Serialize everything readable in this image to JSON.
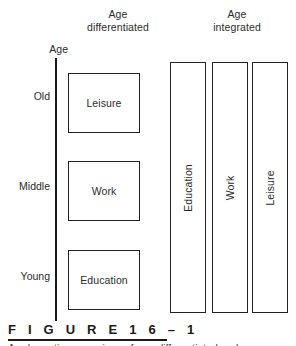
{
  "figure": {
    "caption_label": "F I G U R E   1 6 – 1",
    "caption_subtext": "A schematic comparison of age-differentiated and age-integrated"
  },
  "headers": {
    "differentiated": {
      "line1": "Age",
      "line2": "differentiated"
    },
    "integrated": {
      "line1": "Age",
      "line2": "integrated"
    }
  },
  "axis": {
    "title": "Age",
    "ticks": [
      {
        "label": "Old"
      },
      {
        "label": "Middle"
      },
      {
        "label": "Young"
      }
    ]
  },
  "differentiated_boxes": [
    {
      "label": "Leisure"
    },
    {
      "label": "Work"
    },
    {
      "label": "Education"
    }
  ],
  "integrated_bars": [
    {
      "label": "Education"
    },
    {
      "label": "Work"
    },
    {
      "label": "Leisure"
    }
  ],
  "colors": {
    "stroke": "#222222",
    "text": "#2b2b2b",
    "background": "#ffffff"
  },
  "chart_data": {
    "type": "diagram",
    "ylabel": "Age",
    "ytick_labels": [
      "Old",
      "Middle",
      "Young"
    ],
    "panels": [
      {
        "name": "Age differentiated",
        "elements": [
          "Leisure",
          "Work",
          "Education"
        ],
        "layout": "three separate boxes stacked by life stage: Leisure at Old, Work at Middle, Education at Young"
      },
      {
        "name": "Age integrated",
        "elements": [
          "Education",
          "Work",
          "Leisure"
        ],
        "layout": "three full-height vertical bars spanning all ages, labels rotated 90 degrees"
      }
    ],
    "grid": false,
    "legend": "none"
  }
}
